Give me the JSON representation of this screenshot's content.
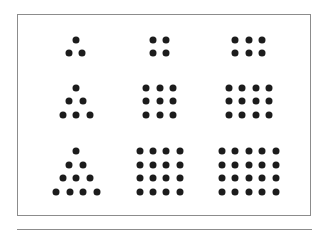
{
  "diagram": {
    "type": "figurate-numbers",
    "dot_color": "#1c1c1c",
    "border_color": "#8c8c8c",
    "rows": [
      {
        "figures": [
          {
            "kind": "triangular",
            "value": 3,
            "dots": [
              [
                76,
                40
              ],
              [
                69,
                53
              ],
              [
                82,
                53
              ]
            ]
          },
          {
            "kind": "square",
            "value": 4,
            "dots": [
              [
                153,
                40
              ],
              [
                166,
                40
              ],
              [
                153,
                53
              ],
              [
                166,
                53
              ]
            ]
          },
          {
            "kind": "oblong",
            "value": 6,
            "dots": [
              [
                235,
                40
              ],
              [
                249,
                40
              ],
              [
                262,
                40
              ],
              [
                235,
                53
              ],
              [
                249,
                53
              ],
              [
                262,
                53
              ]
            ]
          }
        ]
      },
      {
        "figures": [
          {
            "kind": "triangular",
            "value": 6,
            "dots": [
              [
                76,
                88
              ],
              [
                69,
                101
              ],
              [
                83,
                101
              ],
              [
                63,
                115
              ],
              [
                76,
                115
              ],
              [
                90,
                115
              ]
            ]
          },
          {
            "kind": "square",
            "value": 9,
            "dots": [
              [
                146,
                88
              ],
              [
                160,
                88
              ],
              [
                173,
                88
              ],
              [
                146,
                101
              ],
              [
                160,
                101
              ],
              [
                173,
                101
              ],
              [
                146,
                115
              ],
              [
                160,
                115
              ],
              [
                173,
                115
              ]
            ]
          },
          {
            "kind": "oblong",
            "value": 12,
            "dots": [
              [
                229,
                88
              ],
              [
                242,
                88
              ],
              [
                256,
                88
              ],
              [
                269,
                88
              ],
              [
                229,
                101
              ],
              [
                242,
                101
              ],
              [
                256,
                101
              ],
              [
                269,
                101
              ],
              [
                229,
                115
              ],
              [
                242,
                115
              ],
              [
                256,
                115
              ],
              [
                269,
                115
              ]
            ]
          }
        ]
      },
      {
        "figures": [
          {
            "kind": "triangular",
            "value": 10,
            "dots": [
              [
                76,
                151
              ],
              [
                69,
                165
              ],
              [
                83,
                165
              ],
              [
                63,
                178
              ],
              [
                76,
                178
              ],
              [
                90,
                178
              ],
              [
                56,
                192
              ],
              [
                70,
                192
              ],
              [
                83,
                192
              ],
              [
                97,
                192
              ]
            ]
          },
          {
            "kind": "square",
            "value": 16,
            "dots": [
              [
                140,
                151
              ],
              [
                153,
                151
              ],
              [
                166,
                151
              ],
              [
                180,
                151
              ],
              [
                140,
                165
              ],
              [
                153,
                165
              ],
              [
                166,
                165
              ],
              [
                180,
                165
              ],
              [
                140,
                178
              ],
              [
                153,
                178
              ],
              [
                166,
                178
              ],
              [
                180,
                178
              ],
              [
                140,
                192
              ],
              [
                153,
                192
              ],
              [
                166,
                192
              ],
              [
                180,
                192
              ]
            ]
          },
          {
            "kind": "oblong",
            "value": 20,
            "dots": [
              [
                222,
                151
              ],
              [
                235,
                151
              ],
              [
                249,
                151
              ],
              [
                262,
                151
              ],
              [
                276,
                151
              ],
              [
                222,
                165
              ],
              [
                235,
                165
              ],
              [
                249,
                165
              ],
              [
                262,
                165
              ],
              [
                276,
                165
              ],
              [
                222,
                178
              ],
              [
                235,
                178
              ],
              [
                249,
                178
              ],
              [
                262,
                178
              ],
              [
                276,
                178
              ],
              [
                222,
                192
              ],
              [
                235,
                192
              ],
              [
                249,
                192
              ],
              [
                262,
                192
              ],
              [
                276,
                192
              ]
            ]
          }
        ]
      }
    ]
  }
}
